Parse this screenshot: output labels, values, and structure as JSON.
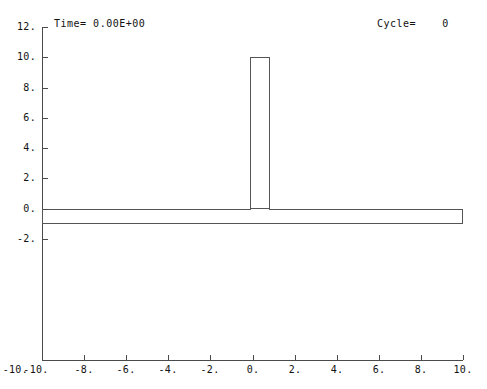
{
  "header": {
    "time_label": "Time= 0.00E+00",
    "cycle_label": "Cycle=    0"
  },
  "chart_data": {
    "type": "line",
    "title": "",
    "subtitle": "",
    "xlabel": "",
    "ylabel": "",
    "grid": false,
    "legend": "none",
    "xlim": [
      -10,
      10
    ],
    "ylim": [
      -10,
      12
    ],
    "x_ticks": [
      -10,
      -8,
      -6,
      -4,
      -2,
      0,
      2,
      4,
      6,
      8,
      10
    ],
    "x_tick_labels": [
      "-10.",
      "-8.",
      "-6.",
      "-4.",
      "-2.",
      "0.",
      "2.",
      "4.",
      "6.",
      "8.",
      "10."
    ],
    "y_ticks": [
      -2,
      0,
      2,
      4,
      6,
      8,
      10,
      12
    ],
    "y_tick_labels": [
      "-2.",
      "0.",
      "2.",
      "4.",
      "6.",
      "8.",
      "10.",
      "12."
    ],
    "y_axis_bottom_value": -10,
    "annotations": [
      {
        "name": "time",
        "text": "Time= 0.00E+00",
        "x": -9.0,
        "y": 11.5
      },
      {
        "name": "cycle",
        "text": "Cycle=    0",
        "x": 5.9,
        "y": 11.5
      }
    ],
    "shapes": [
      {
        "name": "base-slab",
        "kind": "rectangle",
        "x_min": -10.0,
        "x_max": 10.0,
        "y_min": -1.0,
        "y_max": 0.0,
        "stroke": "#555555",
        "fill": "#ffffff"
      },
      {
        "name": "vertical-column",
        "kind": "rectangle",
        "x_min": -0.1,
        "x_max": 0.85,
        "y_min": 0.0,
        "y_max": 10.0,
        "stroke": "#555555",
        "fill": "#ffffff"
      }
    ],
    "series": [
      {
        "name": "mesh-outline",
        "values": [],
        "description": "T-shaped mesh geometry outline: vertical column on horizontal base slab"
      }
    ]
  },
  "colors": {
    "background": "#ffffff",
    "axis": "#4a4a4a",
    "outline": "#555555",
    "text": "#111111"
  }
}
